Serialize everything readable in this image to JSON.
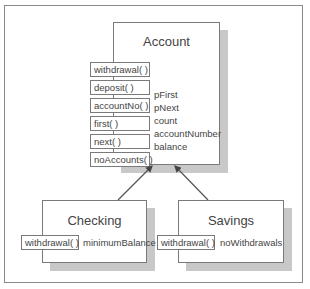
{
  "diagram": {
    "colors": {
      "line": "#555555",
      "shadow": "#c8c8c8",
      "border": "#7a7a7a"
    },
    "account": {
      "title": "Account",
      "methods": [
        "withdrawal( )",
        "deposit( )",
        "accountNo( )",
        "first( )",
        "next( )",
        "noAccounts( )"
      ],
      "attributes": [
        "pFirst",
        "pNext",
        "count",
        "accountNumber",
        "balance"
      ]
    },
    "checking": {
      "title": "Checking",
      "methods": [
        "withdrawal( )"
      ],
      "attributes": [
        "minimumBalance"
      ]
    },
    "savings": {
      "title": "Savings",
      "methods": [
        "withdrawal( )"
      ],
      "attributes": [
        "noWithdrawals"
      ]
    },
    "relations": [
      {
        "from": "checking",
        "to": "account",
        "type": "inheritance-arrow"
      },
      {
        "from": "savings",
        "to": "account",
        "type": "inheritance-arrow"
      }
    ]
  }
}
